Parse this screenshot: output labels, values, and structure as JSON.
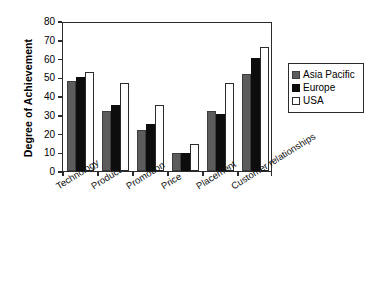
{
  "chart_data": {
    "type": "bar",
    "title": "",
    "subtitle": "",
    "xlabel": "",
    "ylabel": "Degree of Achievement",
    "ylim": [
      0,
      80
    ],
    "ytick_step": 10,
    "yticks": [
      "80",
      "70",
      "60",
      "50",
      "40",
      "30",
      "20",
      "10",
      "0"
    ],
    "grid": false,
    "legend_position": "right",
    "categories": [
      "Technology",
      "Product",
      "Promotion",
      "Price",
      "Placement",
      "Customer relationships"
    ],
    "series": [
      {
        "name": "Asia Pacific",
        "color": "#5c5c5c",
        "values": [
          48,
          32,
          22,
          9.5,
          32,
          52
        ]
      },
      {
        "name": "Europe",
        "color": "#0d0d0d",
        "values": [
          50,
          35,
          25,
          9.5,
          30.5,
          60.5
        ]
      },
      {
        "name": "USA",
        "color": "#ffffff",
        "values": [
          53,
          47,
          35,
          14.5,
          47,
          66
        ]
      }
    ]
  },
  "legend": {
    "items": [
      {
        "label": "Asia Pacific"
      },
      {
        "label": "Europe"
      },
      {
        "label": "USA"
      }
    ]
  },
  "axes": {
    "y_title": "Degree of Achievement"
  }
}
